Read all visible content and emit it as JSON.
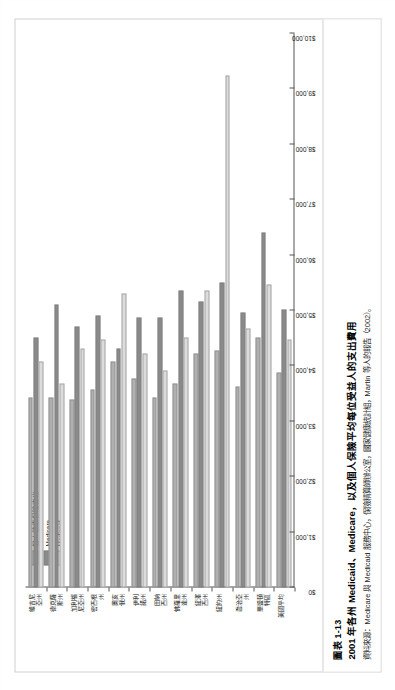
{
  "figure": {
    "number": "圖表 1-13",
    "title": "2001 年各州 Medicaid、Medicare，以及個人保險平均每位受益人的支出費用",
    "source": "資料來源：Medicare 與 Medicaid 服務中心，保險精算師辦公室，國家健康統計組，Martin 等人的報告（2002）。"
  },
  "legend": {
    "items": [
      {
        "label": "個人健康保險支出",
        "color": "#b0b0b0"
      },
      {
        "label": "Medicare",
        "color": "#8a8a8a"
      },
      {
        "label": "Medicaid",
        "color": "#dcdcdc"
      }
    ]
  },
  "chart_data": {
    "type": "bar",
    "orientation": "horizontal",
    "title": "2001 年各州 Medicaid、Medicare，以及個人保險平均每位受益人的支出費用",
    "xlabel": "",
    "ylabel": "",
    "xlim": [
      0,
      10000
    ],
    "grid": false,
    "legend_position": "top-left",
    "tick_labels": [
      "$0",
      "$1,000",
      "$2,000",
      "$3,000",
      "$4,000",
      "$5,000",
      "$6,000",
      "$7,000",
      "$8,000",
      "$9,000",
      "$10,000"
    ],
    "tick_values": [
      0,
      1000,
      2000,
      3000,
      4000,
      5000,
      6000,
      7000,
      8000,
      9000,
      10000
    ],
    "categories": [
      "維吉尼\n亞州",
      "德克薩\n斯州",
      "加利福\n尼亞州",
      "密西根\n州",
      "奧亥\n俄州",
      "伊利\n諾州",
      "田納\n西州",
      "佛羅里\n達州",
      "紐澤\n西州",
      "紐約州",
      "喬治亞\n州",
      "華盛頓\n特區",
      "美國平均"
    ],
    "series": [
      {
        "name": "個人健康保險支出",
        "color": "#b0b0b0",
        "values": [
          3450,
          3450,
          3420,
          3600,
          4100,
          3800,
          3450,
          3700,
          4250,
          4300,
          3650,
          4550,
          3900
        ]
      },
      {
        "name": "Medicare",
        "color": "#8a8a8a",
        "values": [
          4550,
          5150,
          4750,
          4950,
          4350,
          4900,
          4900,
          5400,
          5200,
          5550,
          5000,
          6450,
          5050
        ]
      },
      {
        "name": "Medicaid",
        "color": "#dcdcdc",
        "values": [
          4100,
          3700,
          4350,
          4500,
          5350,
          4250,
          3950,
          4550,
          5400,
          9300,
          4700,
          5500,
          4500
        ]
      }
    ]
  }
}
